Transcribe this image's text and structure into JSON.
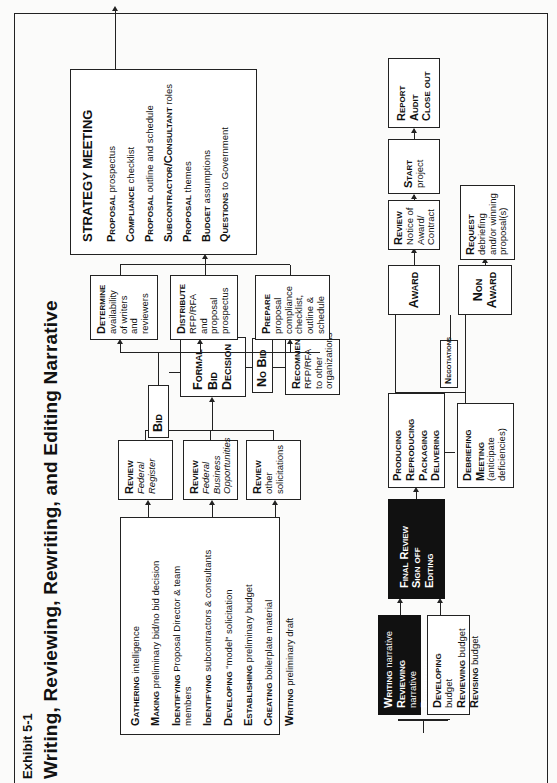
{
  "header": {
    "exhibit": "Exhibit 5-1",
    "title": "Writing, Reviewing, Rewriting, and Editing Narrative"
  },
  "prep_list": [
    {
      "verb": "Gathering",
      "rest": " intelligence"
    },
    {
      "verb": "Making",
      "rest": " preliminary bid/no bid decision"
    },
    {
      "verb": "Identifying",
      "rest": " Proposal Director & team members"
    },
    {
      "verb": "Identifying",
      "rest": " subcontractors & consultants"
    },
    {
      "verb": "Developing",
      "rest": " “model” solicitation"
    },
    {
      "verb": "Establishing",
      "rest": " preliminary budget"
    },
    {
      "verb": "Creating",
      "rest": " boilerplate material"
    },
    {
      "verb": "Writing",
      "rest": " preliminary draft"
    }
  ],
  "reviews": [
    {
      "verb": "Review",
      "detail": "Federal Register",
      "italic": true
    },
    {
      "verb": "Review",
      "detail": "Federal Business Opportunities",
      "italic": true
    },
    {
      "verb": "Review",
      "detail": "other solicitations",
      "italic": false
    }
  ],
  "decision": {
    "bid": "Bid",
    "formal": [
      "Formal",
      "Bid",
      "Decision"
    ],
    "no_bid": "No Bid",
    "recommend_verb": "Recommend",
    "recommend_detail": "RFP/RFA to other organizations"
  },
  "bid_actions": [
    {
      "verb": "Determine",
      "detail": "availability of writers and reviewers"
    },
    {
      "verb": "Distribute",
      "detail": "RFP/RFA and proposal prospectus"
    },
    {
      "verb": "Prepare",
      "detail": "proposal compliance checklist, outline & schedule"
    }
  ],
  "strategy_meeting": {
    "heading": "STRATEGY MEETING",
    "items": [
      {
        "key": "Proposal",
        "rest": " prospectus"
      },
      {
        "key": "Compliance",
        "rest": " checklist"
      },
      {
        "key": "Proposal",
        "rest": " outline and schedule"
      },
      {
        "key": "Subcontractor/Consultant",
        "rest": " roles"
      },
      {
        "key": "Proposal",
        "rest": " themes"
      },
      {
        "key": "Budget",
        "rest": " assumptions"
      },
      {
        "key": "Questions",
        "rest": " to Government"
      }
    ]
  },
  "writing_box": [
    {
      "verb": "Writing",
      "rest": " narrative"
    },
    {
      "verb": "Reviewing",
      "rest": " narrative"
    },
    {
      "verb": "Rewriting",
      "rest": " narrative"
    }
  ],
  "budget_box": [
    {
      "verb": "Developing",
      "rest": " budget"
    },
    {
      "verb": "Reviewing",
      "rest": " budget"
    },
    {
      "verb": "Revising",
      "rest": " budget"
    }
  ],
  "final_review": [
    "Final Review",
    "Sign off",
    "Editing"
  ],
  "producing": [
    "Producing",
    "Reproducing",
    "Packaging",
    "Delivering"
  ],
  "debriefing": {
    "lines": [
      "Debriefing",
      "Meeting"
    ],
    "note": "(anticipate deficiencies)"
  },
  "negotiations": "Negotiations",
  "award": "Award",
  "non_award": [
    "Non",
    "Award"
  ],
  "review_notice": {
    "verb": "Review",
    "detail": "Notice of Award/ Contract"
  },
  "start": {
    "verb": "Start",
    "detail": "project"
  },
  "report": [
    "Report",
    "Audit",
    "Close out"
  ],
  "request": {
    "verb": "Request",
    "detail": "debriefing and/or winning proposal(s)"
  }
}
